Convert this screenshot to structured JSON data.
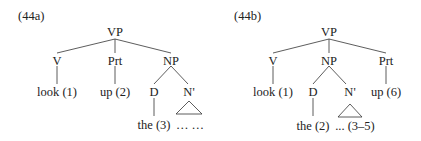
{
  "trees": [
    {
      "id": "44a",
      "label": "(44a)",
      "nodes": {
        "vp": "VP",
        "v": "V",
        "prt": "Prt",
        "np": "NP",
        "d": "D",
        "nbar": "N'",
        "look": "look (1)",
        "up": "up (2)",
        "the": "the (3)",
        "rest": "… …"
      }
    },
    {
      "id": "44b",
      "label": "(44b)",
      "nodes": {
        "vp": "VP",
        "v": "V",
        "np": "NP",
        "prt": "Prt",
        "d": "D",
        "nbar": "N'",
        "look": "look (1)",
        "up": "up (6)",
        "the": "the (2)",
        "rest": "... (3–5)"
      }
    }
  ]
}
